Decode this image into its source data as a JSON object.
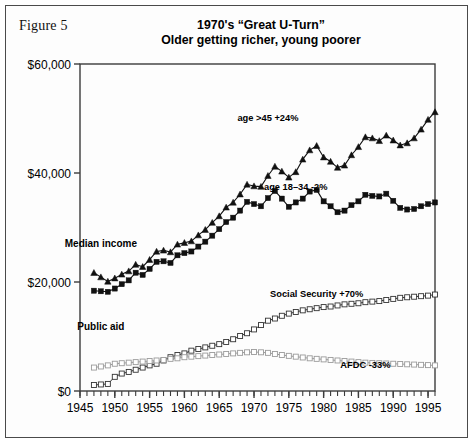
{
  "figure": {
    "caption": "Figure 5",
    "title_line1": "1970's “Great U-Turn”",
    "title_line2": "Older getting richer, young poorer"
  },
  "chart_data": {
    "type": "line",
    "xlabel": "",
    "ylabel": "",
    "xlim": [
      1945,
      1996
    ],
    "ylim": [
      0,
      60000
    ],
    "grid": false,
    "legend_position": "inline-annotations",
    "y_ticks": [
      0,
      20000,
      40000,
      60000
    ],
    "y_tick_labels": [
      "$0",
      "$20,000",
      "$40,000",
      "$60,000"
    ],
    "x_ticks": [
      1945,
      1950,
      1955,
      1960,
      1965,
      1970,
      1975,
      1980,
      1985,
      1990,
      1995
    ],
    "x_tick_labels": [
      "1945",
      "1950",
      "1955",
      "1960",
      "1965",
      "1970",
      "1975",
      "1980",
      "1985",
      "1990",
      "1995"
    ],
    "x_minor_tick_interval": 1,
    "annotations": [
      {
        "text": "age >45 +24%",
        "x": 1972,
        "y": 49500
      },
      {
        "text": "age 18–34 -2%",
        "x": 1976,
        "y": 36800
      },
      {
        "text": "Median income",
        "x": 1948,
        "y": 26500
      },
      {
        "text": "Social Security +70%",
        "x": 1979,
        "y": 17200
      },
      {
        "text": "Public aid",
        "x": 1948,
        "y": 11200
      },
      {
        "text": "AFDC -33%",
        "x": 1986,
        "y": 4200
      }
    ],
    "x": [
      1947,
      1948,
      1949,
      1950,
      1951,
      1952,
      1953,
      1954,
      1955,
      1956,
      1957,
      1958,
      1959,
      1960,
      1961,
      1962,
      1963,
      1964,
      1965,
      1966,
      1967,
      1968,
      1969,
      1970,
      1971,
      1972,
      1973,
      1974,
      1975,
      1976,
      1977,
      1978,
      1979,
      1980,
      1981,
      1982,
      1983,
      1984,
      1985,
      1986,
      1987,
      1988,
      1989,
      1990,
      1991,
      1992,
      1993,
      1994,
      1995,
      1996
    ],
    "series": [
      {
        "name": "age >45 +24%",
        "marker": "filled-triangle",
        "color": "#111111",
        "values": [
          21700,
          20900,
          20100,
          20700,
          21400,
          22000,
          23200,
          22800,
          24100,
          25600,
          25800,
          25500,
          26900,
          27200,
          27500,
          28600,
          29600,
          30900,
          32100,
          33700,
          34600,
          36100,
          37900,
          37600,
          37500,
          39500,
          41200,
          40300,
          39200,
          40200,
          42500,
          44200,
          45000,
          42900,
          42100,
          41000,
          41400,
          43300,
          44800,
          46600,
          46400,
          45900,
          46900,
          46000,
          45100,
          45500,
          46400,
          48000,
          49800,
          51200
        ]
      },
      {
        "name": "age 18–34 -2%",
        "marker": "filled-square",
        "color": "#111111",
        "values": [
          18400,
          18300,
          18200,
          18800,
          19600,
          20300,
          21700,
          21300,
          22400,
          23700,
          23800,
          23500,
          24900,
          25300,
          25600,
          26500,
          27400,
          28500,
          29700,
          31000,
          31800,
          33100,
          34700,
          34300,
          33900,
          35400,
          36700,
          35300,
          33800,
          34600,
          35300,
          36600,
          36900,
          34800,
          33900,
          32800,
          33100,
          34100,
          34800,
          36000,
          35800,
          35700,
          36200,
          34900,
          33600,
          33300,
          33400,
          33900,
          34300,
          34600
        ]
      },
      {
        "name": "Social Security +70%",
        "marker": "open-square",
        "color": "#333333",
        "values": [
          1100,
          1200,
          1300,
          2600,
          3200,
          3500,
          3900,
          4300,
          4700,
          5000,
          5600,
          6200,
          6600,
          6900,
          7400,
          7700,
          8000,
          8300,
          8600,
          9000,
          9500,
          10100,
          10600,
          11300,
          12100,
          12900,
          13300,
          13800,
          14200,
          14500,
          14800,
          15000,
          15200,
          15400,
          15500,
          15700,
          15900,
          16000,
          16100,
          16300,
          16400,
          16500,
          16700,
          16900,
          17100,
          17200,
          17300,
          17400,
          17500,
          17700
        ]
      },
      {
        "name": "AFDC -33%",
        "marker": "open-square",
        "color": "#9a9a9a",
        "values": [
          4300,
          4500,
          4700,
          5000,
          5100,
          5200,
          5300,
          5400,
          5500,
          5600,
          5700,
          5900,
          6000,
          6200,
          6300,
          6400,
          6500,
          6600,
          6700,
          6800,
          6900,
          7000,
          7100,
          7150,
          7100,
          7000,
          6800,
          6600,
          6450,
          6300,
          6150,
          6000,
          5900,
          5800,
          5700,
          5600,
          5500,
          5400,
          5300,
          5200,
          5150,
          5100,
          5050,
          5000,
          4950,
          4900,
          4850,
          4800,
          4750,
          4700
        ]
      }
    ]
  }
}
